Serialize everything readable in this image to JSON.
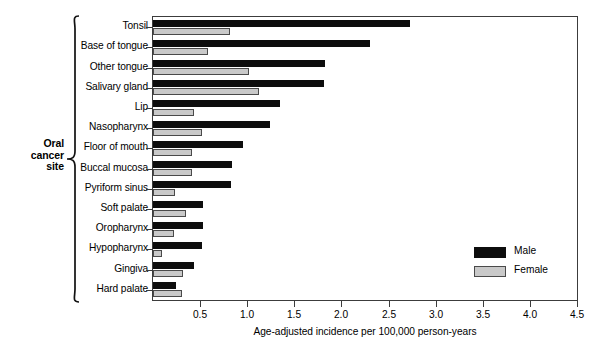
{
  "chart_data": {
    "type": "bar",
    "orientation": "horizontal",
    "title": "",
    "xlabel": "Age-adjusted incidence per 100,000 person-years",
    "ylabel": "Oral cancer site",
    "xlim": [
      0,
      4.5
    ],
    "xticks": [
      "0.5",
      "1.0",
      "1.5",
      "2.0",
      "2.5",
      "3.0",
      "3.5",
      "4.0",
      "4.5"
    ],
    "xtick_values": [
      0.5,
      1.0,
      1.5,
      2.0,
      2.5,
      3.0,
      3.5,
      4.0,
      4.5
    ],
    "grid": false,
    "legend_position": "right-inside-lower",
    "categories": [
      "Tonsil",
      "Base of tongue",
      "Other tongue",
      "Salivary gland",
      "Lip",
      "Nasopharynx",
      "Floor of mouth",
      "Buccal mucosa",
      "Pyriform sinus",
      "Soft palate",
      "Oropharynx",
      "Hypopharynx",
      "Gingiva",
      "Hard palate"
    ],
    "series": [
      {
        "name": "Male",
        "color": "#0d0d0d",
        "values": [
          2.73,
          2.3,
          1.83,
          1.82,
          1.35,
          1.24,
          0.96,
          0.84,
          0.83,
          0.53,
          0.53,
          0.52,
          0.43,
          0.24
        ]
      },
      {
        "name": "Female",
        "color": "#c9c9c9",
        "values": [
          0.82,
          0.58,
          1.02,
          1.13,
          0.43,
          0.52,
          0.41,
          0.41,
          0.23,
          0.35,
          0.22,
          0.1,
          0.32,
          0.31
        ]
      }
    ]
  },
  "legend": {
    "items": [
      {
        "label": "Male",
        "swatch": "male"
      },
      {
        "label": "Female",
        "swatch": "female"
      }
    ]
  },
  "axis": {
    "y_title_lines": [
      "Oral",
      "cancer",
      "site"
    ]
  }
}
